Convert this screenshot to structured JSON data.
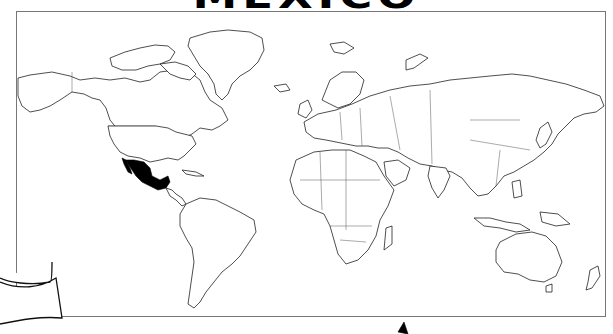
{
  "title": "MEXICO",
  "map": {
    "type": "world political outline map",
    "highlighted_country": "Mexico",
    "highlight_color": "#000000",
    "outline_color": "#222222",
    "background_color": "#ffffff"
  }
}
